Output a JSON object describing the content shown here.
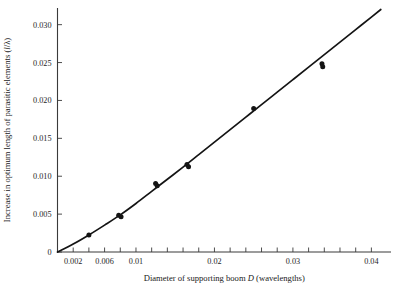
{
  "chart_data": {
    "type": "scatter",
    "title": "",
    "xlabel": "Diameter of supporting boom D (wavelengths)",
    "xlabel_parts": {
      "pre": "Diameter of supporting boom ",
      "italic": "D",
      "post": " (wavelengths)"
    },
    "ylabel": "Increase in optimum length of parasitic elements (l/λ)",
    "ylabel_parts": {
      "pre": "Increase in optimum length of parasitic elements (",
      "italic": "l",
      "post": "/λ)"
    },
    "xlim": [
      0,
      0.0425
    ],
    "ylim": [
      0,
      0.0322
    ],
    "grid": false,
    "legend": null,
    "x_ticks": [
      0.002,
      0.004,
      0.006,
      0.008,
      0.01,
      0.012,
      0.014,
      0.016,
      0.018,
      0.02,
      0.022,
      0.024,
      0.026,
      0.028,
      0.03,
      0.032,
      0.034,
      0.036,
      0.038,
      0.04
    ],
    "x_tick_labels": [
      {
        "value": 0.002,
        "label": "0.002"
      },
      {
        "value": 0.006,
        "label": "0.006"
      },
      {
        "value": 0.01,
        "label": "0.01"
      },
      {
        "value": 0.02,
        "label": "0.02"
      },
      {
        "value": 0.03,
        "label": "0.03"
      },
      {
        "value": 0.04,
        "label": "0.04"
      }
    ],
    "y_ticks": [
      0,
      0.005,
      0.01,
      0.015,
      0.02,
      0.025,
      0.03
    ],
    "y_tick_labels": [
      {
        "value": 0,
        "label": "0"
      },
      {
        "value": 0.005,
        "label": "0.005"
      },
      {
        "value": 0.01,
        "label": "0.010"
      },
      {
        "value": 0.015,
        "label": "0.015"
      },
      {
        "value": 0.02,
        "label": "0.020"
      },
      {
        "value": 0.025,
        "label": "0.025"
      },
      {
        "value": 0.03,
        "label": "0.030"
      }
    ],
    "series": [
      {
        "name": "measured points",
        "marker": "filled-circle",
        "color": "#141414",
        "points": [
          {
            "x": 0.004,
            "y": 0.00225
          },
          {
            "x": 0.0078,
            "y": 0.00485
          },
          {
            "x": 0.0081,
            "y": 0.00465
          },
          {
            "x": 0.0125,
            "y": 0.00905
          },
          {
            "x": 0.0127,
            "y": 0.00875
          },
          {
            "x": 0.0165,
            "y": 0.01155
          },
          {
            "x": 0.0167,
            "y": 0.01125
          },
          {
            "x": 0.025,
            "y": 0.01895
          },
          {
            "x": 0.0337,
            "y": 0.02485
          },
          {
            "x": 0.0338,
            "y": 0.02445
          }
        ]
      },
      {
        "name": "fitted curve",
        "marker": "none",
        "color": "#141414",
        "points": [
          {
            "x": 0.0,
            "y": 0.0
          },
          {
            "x": 0.002,
            "y": 0.00105
          },
          {
            "x": 0.004,
            "y": 0.00225
          },
          {
            "x": 0.006,
            "y": 0.00355
          },
          {
            "x": 0.008,
            "y": 0.0049
          },
          {
            "x": 0.01,
            "y": 0.0064
          },
          {
            "x": 0.012,
            "y": 0.008
          },
          {
            "x": 0.014,
            "y": 0.0096
          },
          {
            "x": 0.016,
            "y": 0.0112
          },
          {
            "x": 0.018,
            "y": 0.01285
          },
          {
            "x": 0.02,
            "y": 0.0145
          },
          {
            "x": 0.022,
            "y": 0.01615
          },
          {
            "x": 0.024,
            "y": 0.0178
          },
          {
            "x": 0.026,
            "y": 0.01945
          },
          {
            "x": 0.028,
            "y": 0.0211
          },
          {
            "x": 0.03,
            "y": 0.02275
          },
          {
            "x": 0.032,
            "y": 0.0244
          },
          {
            "x": 0.034,
            "y": 0.02605
          },
          {
            "x": 0.036,
            "y": 0.0277
          },
          {
            "x": 0.038,
            "y": 0.02935
          },
          {
            "x": 0.04,
            "y": 0.031
          },
          {
            "x": 0.0412,
            "y": 0.032
          }
        ]
      }
    ]
  }
}
